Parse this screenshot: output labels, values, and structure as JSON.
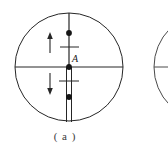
{
  "figure": {
    "caption": "( a )",
    "center_label": "A",
    "background_color": "#ffffff",
    "stroke_color": "#262626",
    "faint_color": "#e7e7e7",
    "canvas": {
      "width": 168,
      "height": 159
    },
    "main_circle": {
      "name": "main-circle",
      "cx": 69,
      "cy": 67,
      "r": 54,
      "stroke_width": 1
    },
    "second_circle": {
      "name": "partial-second-circle",
      "cx": 208,
      "cy": 67,
      "r": 54,
      "stroke_width": 1
    },
    "horizontal_axis": {
      "name": "horizontal-axis-line",
      "x1": 15,
      "y1": 67,
      "x2": 123,
      "y2": 67
    },
    "second_horizontal_axis": {
      "name": "second-horizontal-axis-line",
      "x1": 154,
      "y1": 67,
      "x2": 168,
      "y2": 67
    },
    "vertical_axis": {
      "name": "vertical-axis-line",
      "x1": 69,
      "y1": 13,
      "x2": 69,
      "y2": 67
    },
    "lower_rail": {
      "name": "lower-double-rail",
      "x_left": 66,
      "x_right": 71,
      "y_top": 67,
      "y_bottom": 122
    },
    "nodes": [
      {
        "name": "node-upper",
        "cx": 69,
        "cy": 33,
        "r": 2.8
      },
      {
        "name": "node-center",
        "cx": 69,
        "cy": 67,
        "r": 2.8
      },
      {
        "name": "node-lower",
        "cx": 69,
        "cy": 97,
        "r": 2.8
      }
    ],
    "ticks": [
      {
        "name": "tick-upper",
        "x1": 60,
        "y1": 47,
        "x2": 79,
        "y2": 47
      },
      {
        "name": "tick-lower",
        "x1": 60,
        "y1": 81,
        "x2": 79,
        "y2": 81
      }
    ],
    "arrows": [
      {
        "name": "arrow-up",
        "x": 50,
        "y_tail": 52,
        "y_head": 33,
        "direction": "up"
      },
      {
        "name": "arrow-down",
        "x": 50,
        "y_tail": 74,
        "y_head": 94,
        "direction": "down"
      }
    ],
    "artifacts": [
      {
        "name": "scan-artifact-left",
        "text": "",
        "x": 10,
        "y": 140
      },
      {
        "name": "scan-artifact-right",
        "text": "",
        "x": 120,
        "y": 140
      }
    ]
  }
}
